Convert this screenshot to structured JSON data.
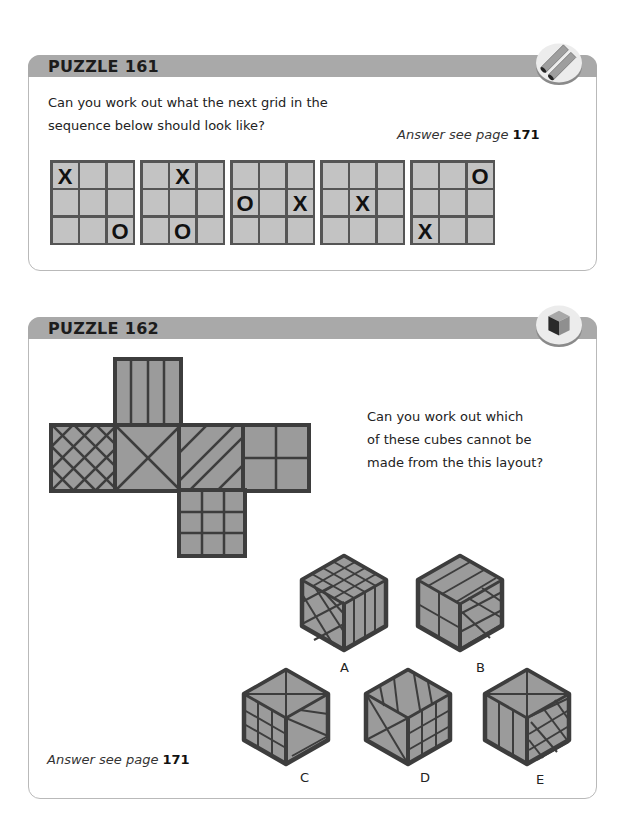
{
  "puzzles": [
    {
      "title": "PUZZLE 161",
      "question": "Can you work out what the next grid in the sequence below should look like?",
      "question_lines": [
        "Can you work out what the next grid in the",
        "sequence below should look like?"
      ],
      "answer_prefix": "Answer see page ",
      "answer_page": "171",
      "badge_icon": "pipes-icon",
      "grids": [
        {
          "cells": [
            "X",
            "",
            "",
            "",
            "",
            "",
            "",
            "",
            "O"
          ]
        },
        {
          "cells": [
            "",
            "X",
            "",
            "",
            "",
            "",
            "",
            "O",
            ""
          ]
        },
        {
          "cells": [
            "",
            "",
            "",
            "O",
            "",
            "X",
            "",
            "",
            ""
          ]
        },
        {
          "cells": [
            "",
            "",
            "",
            "",
            "X",
            "",
            "",
            "",
            ""
          ]
        },
        {
          "cells": [
            "",
            "",
            "O",
            "",
            "",
            "",
            "X",
            "",
            ""
          ]
        }
      ]
    },
    {
      "title": "PUZZLE 162",
      "question_lines": [
        "Can you work out which",
        "of these cubes cannot be",
        "made from the this layout?"
      ],
      "answer_prefix": "Answer see page ",
      "answer_page": "171",
      "badge_icon": "cube-icon",
      "net_faces": [
        "vertical-stripes",
        "diagonal-crosshatch",
        "x-cross",
        "diagonal-stripes",
        "quarters",
        "3x3-grid"
      ],
      "cubes": [
        {
          "label": "A"
        },
        {
          "label": "B"
        },
        {
          "label": "C"
        },
        {
          "label": "D"
        },
        {
          "label": "E"
        }
      ]
    }
  ],
  "colors": {
    "header": "#a9a9a9",
    "face_fill": "#9b9b9b",
    "cell_fill": "#c3c3c3",
    "line": "#3d3d3d"
  }
}
